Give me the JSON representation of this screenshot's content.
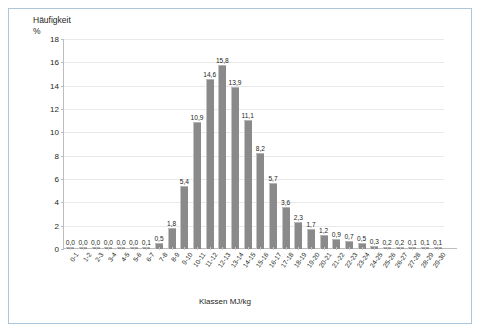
{
  "chart_data": {
    "type": "bar",
    "title": "",
    "subtitle": "",
    "ylabel": "Häufigkeit\n%",
    "ylabel_text": "Häufigkeit",
    "ylabel_unit": "%",
    "xlabel": "Klassen MJ/kg",
    "ylim": [
      0,
      18
    ],
    "y_ticks": [
      0,
      2,
      4,
      6,
      8,
      10,
      12,
      14,
      16,
      18
    ],
    "y_tick_labels": [
      "0",
      "2",
      "4",
      "6",
      "8",
      "10",
      "12",
      "14",
      "16",
      "18"
    ],
    "grid": true,
    "grid_axis": "y",
    "legend": false,
    "legend_position": "none",
    "bar_color": "#8a8a8a",
    "bar_edge_color": "#c3c3c3",
    "decimal_separator": ",",
    "categories": [
      "0-1",
      "1-2",
      "2-3",
      "3-4",
      "4-5",
      "5-6",
      "6-7",
      "7-8",
      "8-9",
      "9-10",
      "10-11",
      "11-12",
      "12-13",
      "13-14",
      "14-15",
      "15-16",
      "16-17",
      "17-18",
      "18-19",
      "19-20",
      "20-21",
      "21-22",
      "22-23",
      "23-24",
      "24-25",
      "25-26",
      "26-27",
      "27-28",
      "28-29",
      "29-30"
    ],
    "values": [
      0.0,
      0.0,
      0.0,
      0.0,
      0.0,
      0.0,
      0.1,
      0.5,
      1.8,
      5.4,
      10.9,
      14.6,
      15.8,
      13.9,
      11.1,
      8.2,
      5.7,
      3.6,
      2.3,
      1.7,
      1.2,
      0.9,
      0.7,
      0.5,
      0.3,
      0.2,
      0.2,
      0.1,
      0.1,
      0.1
    ],
    "value_labels": [
      "0,0",
      "0,0",
      "0,0",
      "0,0",
      "0,0",
      "0,0",
      "0,1",
      "0,5",
      "1,8",
      "5,4",
      "10,9",
      "14,6",
      "15,8",
      "13,9",
      "11,1",
      "8,2",
      "5,7",
      "3,6",
      "2,3",
      "1,7",
      "1,2",
      "0,9",
      "0,7",
      "0,5",
      "0,3",
      "0,2",
      "0,2",
      "0,1",
      "0,1",
      "0,1"
    ]
  },
  "figure": {
    "border_color": "#a9c8de",
    "background": "#ffffff"
  }
}
